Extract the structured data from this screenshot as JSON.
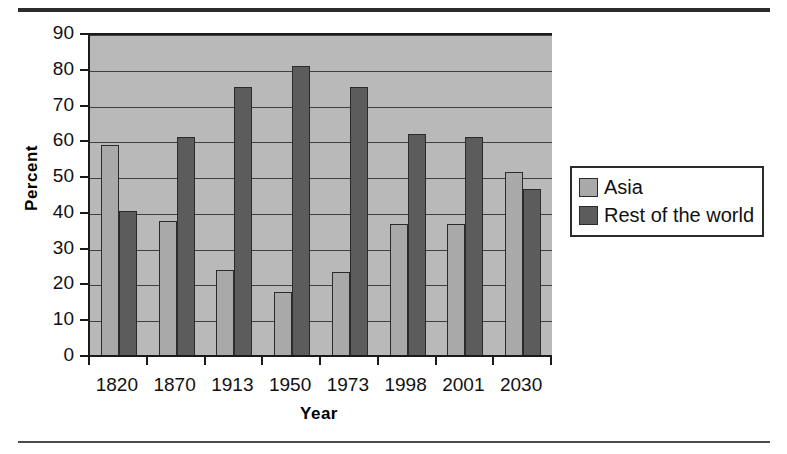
{
  "chart_data": {
    "type": "bar",
    "title": "",
    "xlabel": "Year",
    "ylabel": "Percent",
    "categories": [
      "1820",
      "1870",
      "1913",
      "1950",
      "1973",
      "1998",
      "2001",
      "2030"
    ],
    "series": [
      {
        "name": "Asia",
        "color": "#a9a9a9",
        "values": [
          59.2,
          38.0,
          24.2,
          18.2,
          23.7,
          37.2,
          37.3,
          51.7
        ]
      },
      {
        "name": "Rest of the world",
        "color": "#5c5c5c",
        "values": [
          40.8,
          61.5,
          75.4,
          81.3,
          75.6,
          62.3,
          61.4,
          46.9
        ]
      }
    ],
    "ylim": [
      0,
      90
    ],
    "ytick_values": [
      0,
      10,
      20,
      30,
      40,
      50,
      60,
      70,
      80,
      90
    ],
    "ytick_labels": [
      "0",
      "10",
      "20",
      "30",
      "40",
      "50",
      "60",
      "70",
      "80",
      "90"
    ],
    "grid": true,
    "legend_position": "right",
    "plot_background": "#b9b9b9",
    "axis_color": "#1a1a1a"
  },
  "legend": {
    "entries": [
      {
        "label": "Asia",
        "swatch": "asia-swatch"
      },
      {
        "label": "Rest of the world",
        "swatch": "rest-of-world-swatch"
      }
    ]
  },
  "axes": {
    "y_title": "Percent",
    "x_title": "Year"
  }
}
